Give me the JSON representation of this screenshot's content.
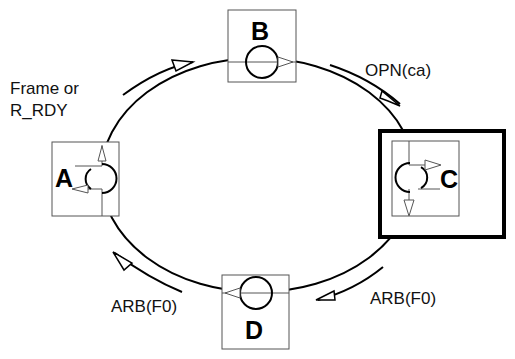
{
  "diagram": {
    "type": "ring",
    "nodes": [
      {
        "id": "A",
        "label": "A",
        "highlighted": false
      },
      {
        "id": "B",
        "label": "B",
        "highlighted": false
      },
      {
        "id": "C",
        "label": "C",
        "highlighted": true
      },
      {
        "id": "D",
        "label": "D",
        "highlighted": false
      }
    ],
    "edges": [
      {
        "from": "A",
        "to": "B",
        "label": "Frame or\nR_RDY"
      },
      {
        "from": "B",
        "to": "C",
        "label": "OPN(ca)"
      },
      {
        "from": "C",
        "to": "D",
        "label": "ARB(F0)"
      },
      {
        "from": "D",
        "to": "A",
        "label": "ARB(F0)"
      }
    ]
  },
  "labels": {
    "frame_line1": "Frame or",
    "frame_line2": "R_RDY",
    "opn": "OPN(ca)",
    "arb_right": "ARB(F0)",
    "arb_left": "ARB(F0)"
  },
  "colors": {
    "stroke": "#000000",
    "box_stroke": "#555555",
    "background": "#ffffff"
  }
}
